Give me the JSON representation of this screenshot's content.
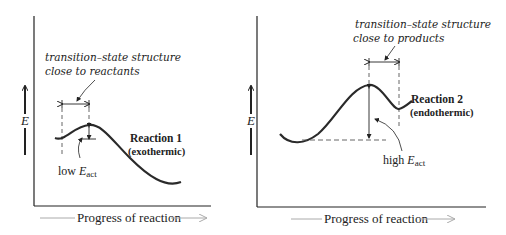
{
  "panels": [
    {
      "id": "reaction-1",
      "y_axis_label": "E",
      "x_axis_label": "Progress of reaction",
      "annotation": {
        "line1": "transition–state structure",
        "line2": "close to reactants"
      },
      "reaction_label": "Reaction 1",
      "reaction_type": "(exothermic)",
      "activation_label_prefix": "low ",
      "activation_symbol": "E",
      "activation_subscript": "act"
    },
    {
      "id": "reaction-2",
      "y_axis_label": "E",
      "x_axis_label": "Progress of reaction",
      "annotation": {
        "line1": "transition–state structure",
        "line2": "close to products"
      },
      "reaction_label": "Reaction 2",
      "reaction_type": "(endothermic)",
      "activation_label_prefix": "high ",
      "activation_symbol": "E",
      "activation_subscript": "act"
    }
  ],
  "colors": {
    "curve": "#2a2a2a",
    "axis": "#222222",
    "dashed": "#555555",
    "progress_arrow": "#aaaaaa"
  }
}
